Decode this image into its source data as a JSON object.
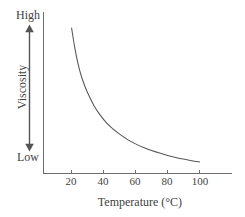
{
  "chart_data": {
    "type": "line",
    "title": "",
    "xlabel": "Temperature (°C)",
    "ylabel": "Viscosity",
    "xlim": [
      10,
      110
    ],
    "ylim": [
      0,
      1
    ],
    "grid": false,
    "legend": null,
    "x_ticks": [
      20,
      40,
      60,
      80,
      100
    ],
    "x_tick_labels": [
      "20",
      "40",
      "60",
      "80",
      "100"
    ],
    "y_axis_annotations": {
      "top": "High",
      "bottom": "Low"
    },
    "series": [
      {
        "name": "Viscosity vs Temperature",
        "color": "#555555",
        "x": [
          20,
          22,
          24,
          26,
          28,
          30,
          34,
          38,
          42,
          46,
          50,
          55,
          60,
          65,
          70,
          75,
          80,
          85,
          90,
          95,
          100
        ],
        "y": [
          1.0,
          0.86,
          0.75,
          0.665,
          0.6,
          0.545,
          0.455,
          0.387,
          0.333,
          0.29,
          0.255,
          0.217,
          0.187,
          0.162,
          0.14,
          0.122,
          0.106,
          0.092,
          0.08,
          0.069,
          0.06
        ]
      }
    ]
  },
  "axes": {
    "x_title": "Temperature (°C)",
    "y_title": "Viscosity",
    "high_label": "High",
    "low_label": "Low",
    "tick_labels": [
      "20",
      "40",
      "60",
      "80",
      "100"
    ]
  },
  "colors": {
    "curve": "#555555",
    "axis": "#6e6e6e",
    "arrow": "#555555",
    "text": "#3f3f3f",
    "background": "#ffffff"
  }
}
